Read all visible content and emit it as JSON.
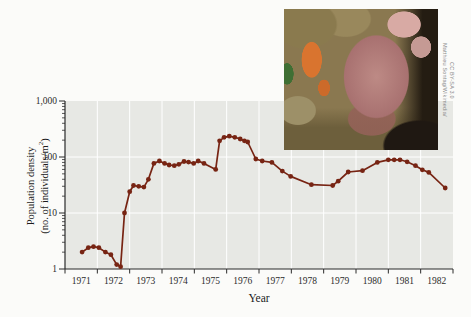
{
  "chart_data": {
    "type": "line",
    "title": "",
    "xlabel": "Year",
    "ylabel": {
      "line1": "Population density",
      "line2_pre": "(no. of individuals/m",
      "line2_sup": "2",
      "line2_post": ")"
    },
    "xlim": [
      1971,
      1983
    ],
    "x_tick_labels": [
      "1971",
      "1972",
      "1973",
      "1974",
      "1975",
      "1976",
      "1977",
      "1978",
      "1979",
      "1980",
      "1981",
      "1982"
    ],
    "y_axis": {
      "scale": "log",
      "lim": [
        1,
        1000
      ],
      "major_ticks": [
        {
          "value": 1,
          "label": "1"
        },
        {
          "value": 10,
          "label": "10"
        },
        {
          "value": 100,
          "label": "100"
        },
        {
          "value": 1000,
          "label": "1,000"
        }
      ]
    },
    "grid": true,
    "legend": null,
    "colors": {
      "line": "#772413",
      "plot_bg": "#e7e8e4",
      "grid": "#ffffff",
      "axis": "#2b2b2b",
      "page_bg": "#fbfbf9"
    },
    "series": [
      {
        "name": "population-density",
        "points": [
          [
            1971.53,
            2.0
          ],
          [
            1971.72,
            2.4
          ],
          [
            1971.88,
            2.5
          ],
          [
            1972.05,
            2.4
          ],
          [
            1972.25,
            2.0
          ],
          [
            1972.42,
            1.8
          ],
          [
            1972.6,
            1.2
          ],
          [
            1972.72,
            1.1
          ],
          [
            1972.84,
            10
          ],
          [
            1973.0,
            24
          ],
          [
            1973.12,
            31
          ],
          [
            1973.28,
            30
          ],
          [
            1973.44,
            29
          ],
          [
            1973.58,
            40
          ],
          [
            1973.75,
            77
          ],
          [
            1973.92,
            85
          ],
          [
            1974.08,
            77
          ],
          [
            1974.22,
            72
          ],
          [
            1974.38,
            70
          ],
          [
            1974.52,
            74
          ],
          [
            1974.68,
            83
          ],
          [
            1974.82,
            81
          ],
          [
            1974.98,
            77
          ],
          [
            1975.12,
            85
          ],
          [
            1975.3,
            77
          ],
          [
            1975.66,
            60
          ],
          [
            1975.78,
            195
          ],
          [
            1975.92,
            225
          ],
          [
            1976.08,
            235
          ],
          [
            1976.25,
            225
          ],
          [
            1976.42,
            210
          ],
          [
            1976.55,
            195
          ],
          [
            1976.65,
            185
          ],
          [
            1976.9,
            92
          ],
          [
            1977.1,
            85
          ],
          [
            1977.4,
            80
          ],
          [
            1977.72,
            56
          ],
          [
            1977.98,
            45
          ],
          [
            1978.62,
            32
          ],
          [
            1979.28,
            31
          ],
          [
            1979.45,
            37
          ],
          [
            1979.76,
            54
          ],
          [
            1980.2,
            57
          ],
          [
            1980.66,
            80
          ],
          [
            1981.0,
            89
          ],
          [
            1981.18,
            89
          ],
          [
            1981.36,
            89
          ],
          [
            1981.58,
            82
          ],
          [
            1981.84,
            70
          ],
          [
            1982.05,
            59
          ],
          [
            1982.25,
            53
          ],
          [
            1982.76,
            28
          ]
        ]
      }
    ]
  },
  "inset": {
    "credit_line1": "Matthieu Sontag/Wikimedia/",
    "credit_line2": "CC BY-SA 3.0"
  }
}
